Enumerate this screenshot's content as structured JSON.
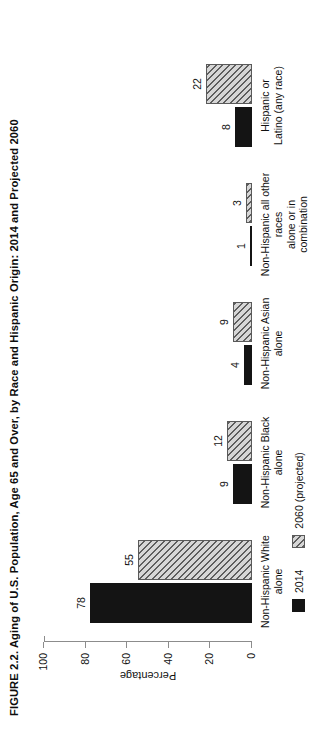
{
  "figure": {
    "title": "FIGURE 2.2. Aging of U.S. Population, Age 65 and Over, by Race and Hispanic Origin: 2014 and Projected 2060"
  },
  "chart_data": {
    "type": "bar",
    "title": "FIGURE 2.2. Aging of U.S. Population, Age 65 and Over, by Race and Hispanic Origin: 2014 and Projected 2060",
    "orientation": "vertical",
    "categories": [
      "Non-Hispanic White\nalone",
      "Non-Hispanic Black\nalone",
      "Non-Hispanic Asian\nalone",
      "Non-Hispanic all other races\nalone or in combination",
      "Hispanic or\nLatino (any race)"
    ],
    "series": [
      {
        "name": "2014",
        "values": [
          78,
          9,
          4,
          1,
          8
        ],
        "color": "#141414",
        "fill": "solid"
      },
      {
        "name": "2060 (projected)",
        "values": [
          55,
          12,
          9,
          3,
          22
        ],
        "color": "#cfcfcf",
        "fill": "diagonal-hatch"
      }
    ],
    "xlabel": "",
    "ylabel": "Percentage",
    "ylim": [
      0,
      100
    ],
    "yticks": [
      0,
      20,
      40,
      60,
      80,
      100
    ],
    "yticklabels": [
      "0",
      "20",
      "40",
      "60",
      "80",
      "100"
    ],
    "grid": false,
    "legend_position": "bottom-left",
    "data_labels": true
  },
  "axis": {
    "ylabel": "Percentage",
    "ticks": [
      "100",
      "80",
      "60",
      "40",
      "20",
      "0"
    ]
  },
  "legend": {
    "items": [
      {
        "label": "2014"
      },
      {
        "label": "2060 (projected)"
      }
    ]
  }
}
